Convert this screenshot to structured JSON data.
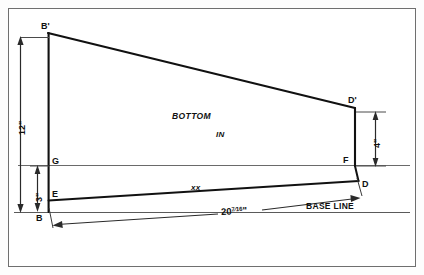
{
  "drawing": {
    "title": "Boat bottom panel layout diagram",
    "background": "#ffffff",
    "line_color": "#111111",
    "frame_color": "#6f6f6f"
  },
  "vertices": {
    "B_prime": {
      "label": "B'",
      "x": 48,
      "y": 33
    },
    "D_prime": {
      "label": "D'",
      "x": 355,
      "y": 108
    },
    "G": {
      "label": "G",
      "x": 48,
      "y": 165
    },
    "F": {
      "label": "F",
      "x": 355,
      "y": 165
    },
    "E": {
      "label": "E",
      "x": 48,
      "y": 200
    },
    "D": {
      "label": "D",
      "x": 358,
      "y": 180
    },
    "B": {
      "label": "B",
      "x": 48,
      "y": 212
    }
  },
  "annotations": {
    "bottom_label": "BOTTOM",
    "in_label": "IN",
    "xx_label": "xx",
    "base_line_label": "BASE LINE"
  },
  "dimensions": {
    "height_left": {
      "value": "12",
      "unit": "\"",
      "text": "12\""
    },
    "height_lower_left": {
      "value": "3",
      "unit": "\"",
      "text": "3\""
    },
    "height_right": {
      "value": "4",
      "unit": "\"",
      "text": "4\""
    },
    "length_base": {
      "whole": "20",
      "numerator": "7",
      "denominator": "16",
      "unit": "\"",
      "text": "20 7/16\""
    }
  }
}
